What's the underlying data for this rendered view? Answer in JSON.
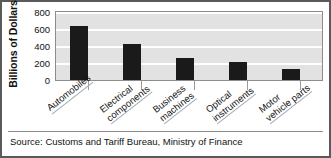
{
  "chart_data": {
    "type": "bar",
    "title": "",
    "xlabel": "",
    "ylabel": "Billions of Dollars",
    "ylim": [
      0,
      800
    ],
    "yticks": [
      800,
      600,
      400,
      200,
      0
    ],
    "grid": true,
    "legend": "none",
    "bar_color": "#1a1a1a",
    "plot_background": "#e2e2e2",
    "categories": [
      "Automobiles",
      "Electrical components",
      "Business machines",
      "Optical instruments",
      "Motor vehicle parts"
    ],
    "category_lines": [
      [
        "Automobiles",
        ""
      ],
      [
        "Electrical",
        "components"
      ],
      [
        "Business",
        "machines"
      ],
      [
        "Optical",
        "instruments"
      ],
      [
        "Motor",
        "vehicle parts"
      ]
    ],
    "values": [
      640,
      420,
      260,
      210,
      130
    ],
    "source": "Source:  Customs and Tariff Bureau, Ministry of Finance"
  }
}
